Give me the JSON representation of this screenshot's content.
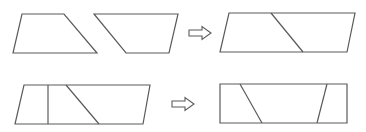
{
  "diagram": {
    "stroke_color": "#5a5a5a",
    "background": "#ffffff",
    "rows": [
      {
        "id": "row-1",
        "inputs": [
          {
            "name": "trapezoid-left",
            "points": "22,14 64,14 97,53 13,53"
          },
          {
            "name": "trapezoid-right",
            "points": "94,14 178,14 169,53 126,53"
          }
        ],
        "arrow": {
          "name": "arrow-right",
          "x": 189,
          "y": 33
        },
        "output": {
          "name": "parallelogram-combined",
          "points": "229,13 355,13 347,52 220,52",
          "cuts": [
            {
              "x1": 271,
              "y1": 13,
              "x2": 303,
              "y2": 52
            }
          ]
        }
      },
      {
        "id": "row-2",
        "inputs": [
          {
            "name": "parallelogram-cut",
            "points": "24,85 150,85 143,124 15,124",
            "cuts": [
              {
                "x1": 48,
                "y1": 85,
                "x2": 48,
                "y2": 124
              },
              {
                "x1": 66,
                "y1": 85,
                "x2": 99,
                "y2": 124
              }
            ]
          }
        ],
        "arrow": {
          "name": "arrow-right",
          "x": 172,
          "y": 104
        },
        "output": {
          "name": "rectangle-result",
          "points": "220,84 347,84 347,123 220,123",
          "cuts": [
            {
              "x1": 240,
              "y1": 84,
              "x2": 262,
              "y2": 123
            },
            {
              "x1": 327,
              "y1": 84,
              "x2": 317,
              "y2": 123
            }
          ]
        }
      }
    ]
  }
}
